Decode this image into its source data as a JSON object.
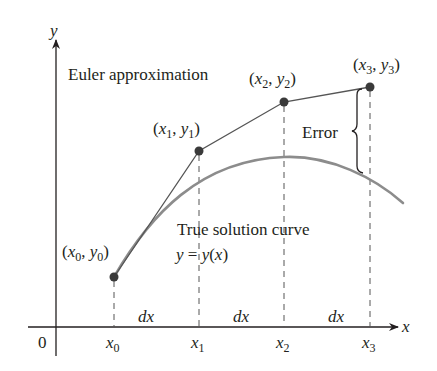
{
  "diagram": {
    "title_label": "Euler approximation",
    "true_curve_label": "True solution curve",
    "true_curve_equation": "y = y(x)",
    "error_label": "Error",
    "axes": {
      "x_label": "x",
      "y_label": "y",
      "origin_label": "0"
    },
    "points": [
      {
        "label_x": "x",
        "sub": "0",
        "label_y": "y"
      },
      {
        "label_x": "x",
        "sub": "1",
        "label_y": "y"
      },
      {
        "label_x": "x",
        "sub": "2",
        "label_y": "y"
      },
      {
        "label_x": "x",
        "sub": "3",
        "label_y": "y"
      }
    ],
    "x_ticks": [
      "x0",
      "x1",
      "x2",
      "x3"
    ],
    "step_label": "dx",
    "colors": {
      "axis": "#231f20",
      "euler_line": "#555555",
      "true_curve": "#8c8c8c",
      "points": "#3a3a3a",
      "dashed": "#555555"
    }
  }
}
